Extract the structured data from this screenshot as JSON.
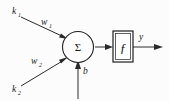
{
  "diagram": {
    "inputs": [
      {
        "signal": "k",
        "signal_sub": "1",
        "weight": "w",
        "weight_sub": "1"
      },
      {
        "signal": "k",
        "signal_sub": "2",
        "weight": "w",
        "weight_sub": "2"
      }
    ],
    "bias": {
      "label": "b"
    },
    "summation": {
      "glyph": "Σ"
    },
    "activation": {
      "glyph": "ƒ"
    },
    "output": {
      "label": "y"
    },
    "colors": {
      "background": "#fcfcfc",
      "stroke": "#2a2a2a",
      "node_fill": "#ffffff",
      "text": "#1a1a1a"
    }
  }
}
